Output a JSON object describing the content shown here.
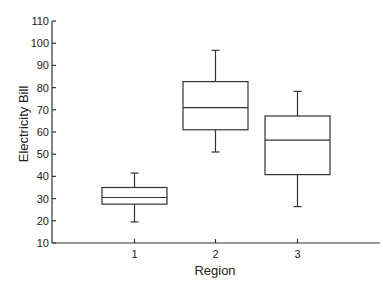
{
  "chart_data": {
    "type": "boxplot",
    "title": "",
    "xlabel": "Region",
    "ylabel": "Electricity Bill",
    "categories": [
      "1",
      "2",
      "3"
    ],
    "ylim": [
      10,
      110
    ],
    "yticks": [
      10,
      20,
      30,
      40,
      50,
      60,
      70,
      80,
      90,
      100,
      110
    ],
    "grid": false,
    "boxes": [
      {
        "category": "1",
        "whisker_low": 19.5,
        "q1": 27.5,
        "median": 30.5,
        "q3": 35,
        "whisker_high": 41.5
      },
      {
        "category": "2",
        "whisker_low": 51,
        "q1": 61,
        "median": 71,
        "q3": 82.7,
        "whisker_high": 96.8
      },
      {
        "category": "3",
        "whisker_low": 26.4,
        "q1": 40.8,
        "median": 56.3,
        "q3": 67.2,
        "whisker_high": 78.3
      }
    ]
  },
  "labels": {
    "xlabel": "Region",
    "ylabel": "Electricity Bill"
  }
}
